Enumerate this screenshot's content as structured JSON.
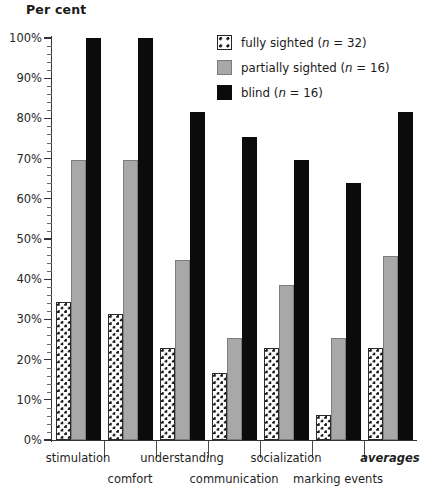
{
  "chart_data": {
    "type": "bar",
    "title": "",
    "ylabel": "Per cent",
    "xlabel": "",
    "ylim": [
      0,
      100
    ],
    "ytick_labels": [
      "0%",
      "10%",
      "20%",
      "30%",
      "40%",
      "50%",
      "60%",
      "70%",
      "80%",
      "90%",
      "100%"
    ],
    "ytick_values": [
      0,
      10,
      20,
      30,
      40,
      50,
      60,
      70,
      80,
      90,
      100
    ],
    "grid": false,
    "legend_position": "top-right",
    "categories": [
      "stimulation",
      "comfort",
      "understanding",
      "communication",
      "socialization",
      "marking events",
      "averages"
    ],
    "series": [
      {
        "name": "fully sighted (n = 32)",
        "key": "fully",
        "color": "#ffffff",
        "pattern": "dotted",
        "values": [
          34.4,
          31.3,
          22.9,
          16.7,
          22.9,
          6.3,
          22.9
        ]
      },
      {
        "name": "partially sighted (n = 16)",
        "key": "partially",
        "color": "#a8a8a8",
        "pattern": "solid",
        "values": [
          69.6,
          69.6,
          44.7,
          25.5,
          38.6,
          25.5,
          45.8
        ]
      },
      {
        "name": "blind (n = 16)",
        "key": "blind",
        "color": "#0b0b0b",
        "pattern": "solid",
        "values": [
          100.0,
          100.0,
          81.6,
          75.4,
          69.6,
          63.9,
          81.6
        ]
      }
    ]
  },
  "legend": {
    "items": [
      {
        "label": "fully sighted (n = 32)",
        "swatch": "fully"
      },
      {
        "label": "partially sighted (n = 16)",
        "swatch": "partially"
      },
      {
        "label": "blind (n = 16)",
        "swatch": "blind"
      }
    ]
  },
  "axis": {
    "y_title": "Per cent"
  }
}
